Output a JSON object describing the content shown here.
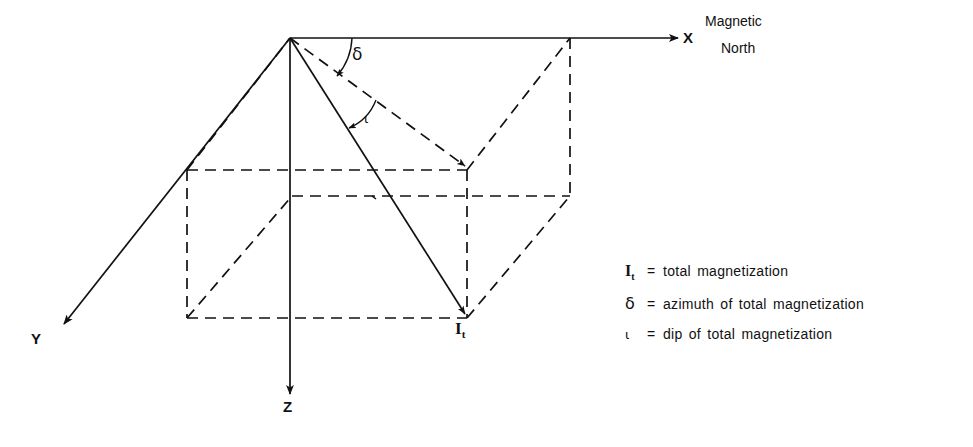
{
  "diagram": {
    "stroke_color": "#111111",
    "background": "#ffffff",
    "axes": [
      {
        "name": "x-axis",
        "label": "X",
        "direction": "right",
        "annotation_line1": "Magnetic",
        "annotation_line2": "North"
      },
      {
        "name": "y-axis",
        "label": "Y",
        "direction": "down-left"
      },
      {
        "name": "z-axis",
        "label": "Z",
        "direction": "down"
      }
    ],
    "vectors": [
      {
        "name": "total-magnetization",
        "label": "I",
        "subscript": "t",
        "style": "solid"
      },
      {
        "name": "horizontal-projection",
        "label": "",
        "style": "dashed"
      }
    ],
    "angles": [
      {
        "name": "declination-angle",
        "symbol": "δ"
      },
      {
        "name": "inclination-angle",
        "symbol": "ι"
      }
    ]
  },
  "labels": {
    "x": "X",
    "y": "Y",
    "z": "Z",
    "magnetic_north_line1": "Magnetic",
    "magnetic_north_line2": "North",
    "delta": "δ",
    "iota": "ι",
    "it_base": "I",
    "it_sub": "t"
  },
  "legend": {
    "items": [
      {
        "symbol": "I",
        "subscript": "t",
        "symbol_kind": "italic",
        "equals": "=",
        "text": "total  magnetization"
      },
      {
        "symbol": "δ",
        "subscript": "",
        "symbol_kind": "greek",
        "equals": "=",
        "text": "azimuth of total magnetization"
      },
      {
        "symbol": "ι",
        "subscript": "",
        "symbol_kind": "greek-iota",
        "equals": "=",
        "text": "dip of total magnetization"
      }
    ]
  }
}
